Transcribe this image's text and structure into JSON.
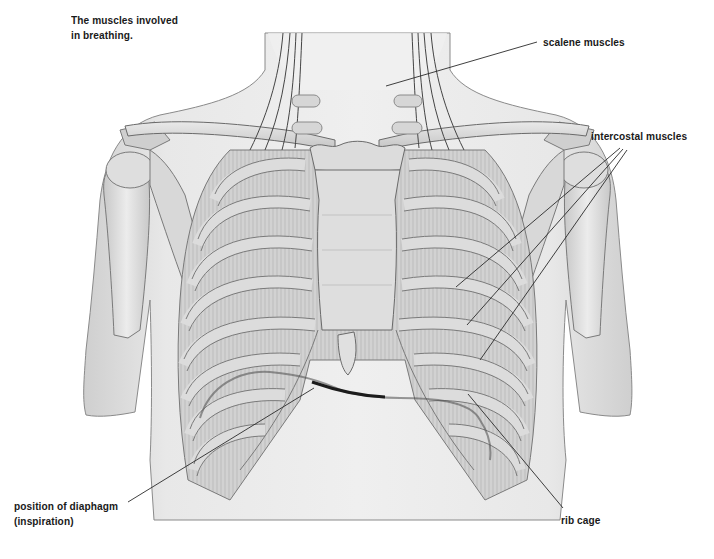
{
  "title": {
    "line1": "The muscles involved",
    "line2": "in breathing."
  },
  "labels": {
    "scalene": "scalene muscles",
    "intercostal": "intercostal muscles",
    "diaphragm_line1": "position of diaphagm",
    "diaphragm_line2": "(inspiration)",
    "rib_cage": "rib cage"
  },
  "colors": {
    "background": "#ffffff",
    "skin": "#e6e6e6",
    "bone": "#d4d4d4",
    "outline": "#6a6a6a",
    "leader_line": "#2a2a2a",
    "diaphragm_line": "#1c1c1c",
    "text": "#1a1a1a"
  }
}
